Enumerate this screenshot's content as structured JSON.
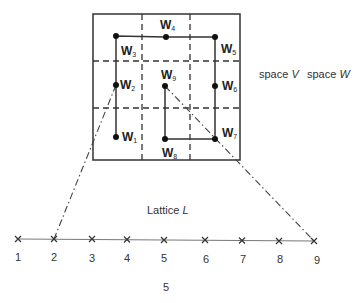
{
  "diagram": {
    "type": "lattice-to-space mapping",
    "grid": {
      "description": "3x3 grid partition of square region",
      "square": {
        "x": 93,
        "y": 14,
        "width": 147,
        "height": 146
      },
      "dashed_vertical_x": [
        142,
        190
      ],
      "dashed_horizontal_y": [
        61,
        108
      ]
    },
    "nodes": [
      {
        "id": "W1",
        "base": "W",
        "sub": "1",
        "x": 116,
        "y": 137
      },
      {
        "id": "W2",
        "base": "W",
        "sub": "2",
        "x": 116,
        "y": 85
      },
      {
        "id": "W3",
        "base": "W",
        "sub": "3",
        "x": 116,
        "y": 36
      },
      {
        "id": "W4",
        "base": "W",
        "sub": "4",
        "x": 166,
        "y": 37
      },
      {
        "id": "W5",
        "base": "W",
        "sub": "5",
        "x": 215,
        "y": 37
      },
      {
        "id": "W6",
        "base": "W",
        "sub": "6",
        "x": 215,
        "y": 86
      },
      {
        "id": "W7",
        "base": "W",
        "sub": "7",
        "x": 215,
        "y": 139
      },
      {
        "id": "W8",
        "base": "W",
        "sub": "8",
        "x": 165,
        "y": 139
      },
      {
        "id": "W9",
        "base": "W",
        "sub": "9",
        "x": 165,
        "y": 86
      }
    ],
    "path_order": [
      "W1",
      "W2",
      "W3",
      "W4",
      "W5",
      "W6",
      "W7",
      "W8",
      "W9"
    ],
    "space_labels": {
      "v_prefix": "space",
      "v_symbol": "V",
      "w_prefix": "space",
      "w_symbol": "W"
    },
    "lattice": {
      "title_prefix": "Lattice",
      "title_symbol": "L",
      "points": [
        {
          "label": "1",
          "x": 18
        },
        {
          "label": "2",
          "x": 54
        },
        {
          "label": "3",
          "x": 92
        },
        {
          "label": "4",
          "x": 127
        },
        {
          "label": "5",
          "x": 164
        },
        {
          "label": "6",
          "x": 205
        },
        {
          "label": "7",
          "x": 242
        },
        {
          "label": "8",
          "x": 279
        },
        {
          "label": "9",
          "x": 314
        }
      ]
    },
    "mappings": [
      {
        "from_lattice": "2",
        "to_node": "W2"
      },
      {
        "from_lattice": "9",
        "to_node": "W9"
      }
    ],
    "footer_label": "5"
  }
}
